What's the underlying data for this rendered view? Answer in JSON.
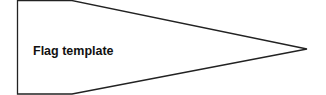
{
  "diagram": {
    "label": "Flag template",
    "shape": "pennant",
    "stroke_color": "#222222",
    "fill_color": "#ffffff"
  }
}
